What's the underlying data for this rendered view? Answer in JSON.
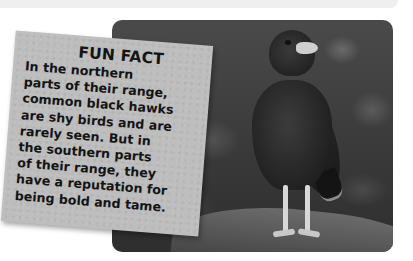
{
  "page": {
    "background": "#ffffff",
    "top_band_color": "#efefef"
  },
  "photo": {
    "subject": "common black hawk perched on a branch",
    "icon": "hawk-photo"
  },
  "fun_fact": {
    "title": "FUN FACT",
    "card_color": "#bdbdbd",
    "lines": [
      "In the northern",
      "parts of their range,",
      "common black hawks",
      "are shy birds and are",
      "rarely seen. But in",
      "the southern parts",
      "of their range, they",
      "have a reputation for",
      "being bold and tame."
    ]
  }
}
